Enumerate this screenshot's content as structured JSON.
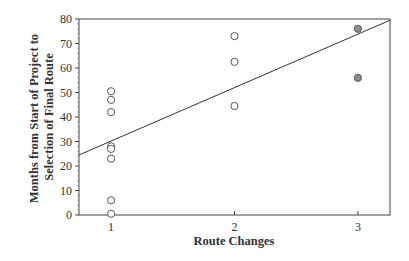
{
  "chart_data": {
    "type": "scatter",
    "title": "",
    "xlabel": "Route Changes",
    "ylabel_lines": [
      "Months from Start of Project to",
      "Selection of Final Route"
    ],
    "ylabel": "Months from Start of Project to Selection of Final Route",
    "xlim": [
      0.74,
      3.26
    ],
    "ylim": [
      0,
      80
    ],
    "x_ticks": [
      1,
      2,
      3
    ],
    "y_ticks": [
      0,
      10,
      20,
      30,
      40,
      50,
      60,
      70,
      80
    ],
    "grid": false,
    "legend": null,
    "series": [
      {
        "name": "open",
        "marker": "open-circle",
        "color": "#ffffff",
        "points": [
          {
            "x": 1,
            "y": 50.5
          },
          {
            "x": 1,
            "y": 47
          },
          {
            "x": 1,
            "y": 42
          },
          {
            "x": 1,
            "y": 28
          },
          {
            "x": 1,
            "y": 27
          },
          {
            "x": 1,
            "y": 23
          },
          {
            "x": 1,
            "y": 6
          },
          {
            "x": 1,
            "y": 0.5
          },
          {
            "x": 2,
            "y": 73
          },
          {
            "x": 2,
            "y": 62.5
          },
          {
            "x": 2,
            "y": 44.5
          }
        ]
      },
      {
        "name": "filled",
        "marker": "filled-circle",
        "color": "#8c8c8c",
        "points": [
          {
            "x": 3,
            "y": 76
          },
          {
            "x": 3,
            "y": 56
          }
        ]
      }
    ],
    "trendline": {
      "x0": 0.74,
      "y0": 24.5,
      "x1": 3.26,
      "y1": 79.5
    }
  }
}
